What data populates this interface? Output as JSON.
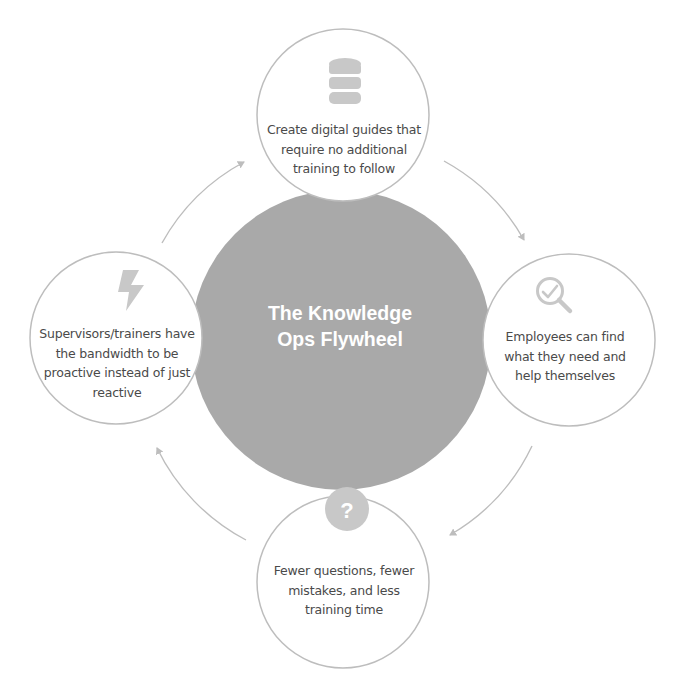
{
  "diagram": {
    "title_lines": [
      "The Knowledge",
      "Ops Flywheel"
    ],
    "colors": {
      "center_fill": "#a9a9a9",
      "node_fill": "#ffffff",
      "node_stroke": "#bdbdbd",
      "arrow_stroke": "#bdbdbd",
      "icon_fill": "#c8c8c8",
      "text": "#4a4a4a",
      "title_text": "#ffffff"
    },
    "nodes": [
      {
        "position": "top",
        "icon": "database-icon",
        "lines": [
          "Create digital guides that",
          "require no additional",
          "training to follow"
        ]
      },
      {
        "position": "right",
        "icon": "search-check-icon",
        "lines": [
          "Employees can find",
          "what they need and",
          "help themselves"
        ]
      },
      {
        "position": "bottom",
        "icon": "question-circle-icon",
        "lines": [
          "Fewer questions, fewer",
          "mistakes, and less",
          "training time"
        ]
      },
      {
        "position": "left",
        "icon": "lightning-bolt-icon",
        "lines": [
          "Supervisors/trainers have",
          "the bandwidth to be",
          "proactive instead of just",
          "reactive"
        ]
      }
    ],
    "flow": [
      "top",
      "right",
      "bottom",
      "left",
      "top"
    ]
  }
}
